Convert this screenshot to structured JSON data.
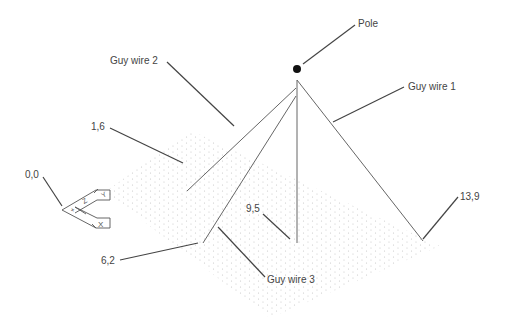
{
  "diagram": {
    "title": "",
    "labels": {
      "pole": "Pole",
      "guy_wire_1": "Guy wire 1",
      "guy_wire_2": "Guy wire 2",
      "guy_wire_3": "Guy wire 3",
      "origin": "0,0",
      "point_1_6": "1,6",
      "point_6_2": "6,2",
      "point_9_5": "9,5",
      "point_13_9": "13,9"
    },
    "axes_icon": {
      "x": "X",
      "y": "Y",
      "z": "Z",
      "plus": "+"
    },
    "colors": {
      "line": "#555555",
      "leader": "#444444",
      "dots": "#c8c8c8",
      "pole": "#111111"
    }
  }
}
